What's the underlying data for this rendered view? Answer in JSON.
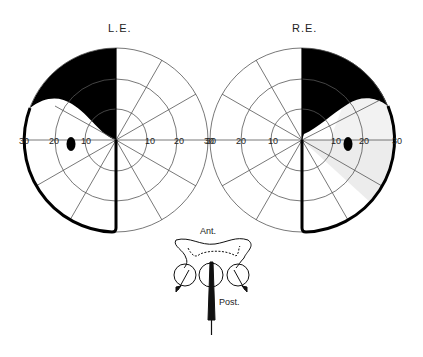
{
  "figure": {
    "type": "visual field perimetry diagram with chiasmal schematic",
    "colors": {
      "ink": "#000000",
      "grid": "#555555",
      "paper": "#ffffff",
      "shading": "#ececec"
    }
  },
  "left_eye": {
    "label": "L.E.",
    "scale_ticks_left": [
      "30",
      "20",
      "10"
    ],
    "center_tick": "0",
    "scale_ticks_right": [
      "10",
      "20",
      "30"
    ],
    "rings_degrees": [
      10,
      20,
      30
    ],
    "defects": [
      "superior temporal quadrant dense field loss (black)",
      "temporal hemifield boundary (thick outline)",
      "blind spot (black oval at ~15° temporal)"
    ]
  },
  "right_eye": {
    "label": "R.E.",
    "scale_ticks_left": [
      "30",
      "20",
      "10"
    ],
    "center_tick": "0",
    "scale_ticks_right": [
      "10",
      "20",
      "30"
    ],
    "rings_degrees": [
      10,
      20,
      30
    ],
    "defects": [
      "superior temporal quadrant dense field loss (black)",
      "inferior temporal relative loss (light shading)",
      "temporal hemifield boundary (thick outline)",
      "blind spot (black oval at ~15° temporal)"
    ]
  },
  "chiasm_schematic": {
    "anterior_label": "Ant.",
    "posterior_label": "Post."
  }
}
